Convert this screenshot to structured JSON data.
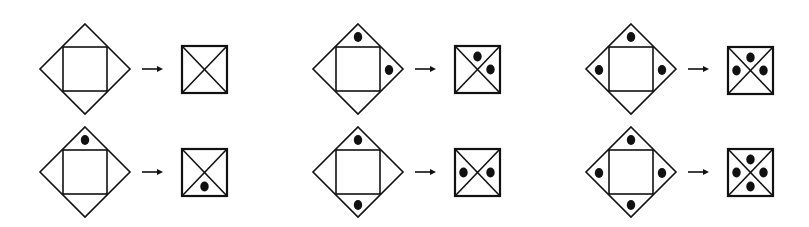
{
  "figure": {
    "colors": {
      "stroke": "#111111",
      "background": "#ffffff"
    },
    "arrow_glyph": "→",
    "pairs": [
      {
        "id": "r1c1",
        "row": 1,
        "col": 1,
        "diamond_center": [
          85,
          69
        ],
        "input_dots": [],
        "output_box": [
          182,
          46
        ],
        "output_dots": []
      },
      {
        "id": "r1c2",
        "row": 1,
        "col": 2,
        "diamond_center": [
          358,
          69
        ],
        "input_dots": [
          "top",
          "right"
        ],
        "output_box": [
          455,
          46
        ],
        "output_dots": [
          "top",
          "right"
        ]
      },
      {
        "id": "r1c3",
        "row": 1,
        "col": 3,
        "diamond_center": [
          631,
          69
        ],
        "input_dots": [
          "top",
          "left",
          "right"
        ],
        "output_box": [
          728,
          47
        ],
        "output_dots": [
          "top",
          "left",
          "right"
        ]
      },
      {
        "id": "r2c1",
        "row": 2,
        "col": 1,
        "diamond_center": [
          85,
          172
        ],
        "input_dots": [
          "top"
        ],
        "output_box": [
          182,
          149
        ],
        "output_dots": [
          "bottom"
        ]
      },
      {
        "id": "r2c2",
        "row": 2,
        "col": 2,
        "diamond_center": [
          358,
          172
        ],
        "input_dots": [
          "top",
          "bottom"
        ],
        "output_box": [
          455,
          149
        ],
        "output_dots": [
          "left",
          "right"
        ]
      },
      {
        "id": "r2c3",
        "row": 2,
        "col": 3,
        "diamond_center": [
          631,
          172
        ],
        "input_dots": [
          "top",
          "left",
          "right",
          "bottom"
        ],
        "output_box": [
          728,
          149
        ],
        "output_dots": [
          "top",
          "left",
          "right",
          "bottom"
        ]
      }
    ]
  }
}
